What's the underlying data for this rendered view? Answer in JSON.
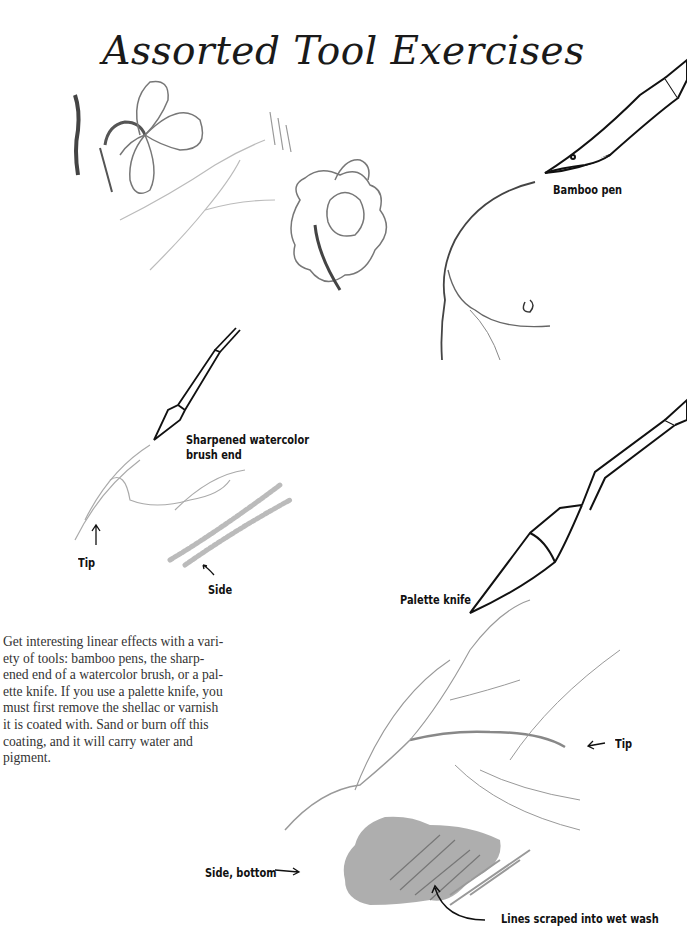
{
  "page": {
    "title": "Assorted Tool Exercises",
    "labels": {
      "bamboo_pen": "Bamboo pen",
      "brush_end_line1": "Sharpened watercolor",
      "brush_end_line2": "brush end",
      "tip_left": "Tip",
      "side": "Side",
      "palette_knife": "Palette knife",
      "tip_right": "Tip",
      "side_bottom": "Side, bottom",
      "lines_scraped": "Lines scraped into wet wash"
    },
    "body_lines": [
      "Get interesting linear effects with a vari-",
      "ety of tools: bamboo pens, the sharp-",
      "ened end of a watercolor brush, or a pal-",
      "ette knife. If you use a palette knife, you",
      "must first remove the shellac or varnish",
      "it is coated with. Sand or burn off this",
      "coating, and it will carry water and",
      "pigment."
    ]
  }
}
